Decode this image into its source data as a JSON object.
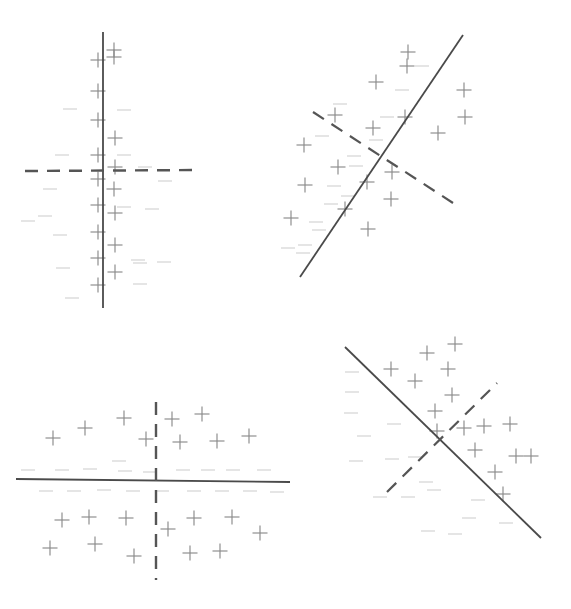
{
  "figure": {
    "title": "",
    "type": "scatter-classification-panels",
    "width": 571,
    "height": 609,
    "background_color": "#ffffff",
    "panel_count": 4,
    "marker_plus_color": "#8a8a8a",
    "marker_minus_color": "#b9b9b9",
    "solid_line_color": "#4a4a4a",
    "dashed_line_color": "#555555"
  },
  "chart_data": {
    "type": "scatter",
    "title": "",
    "subtitle": "",
    "xlabel": "",
    "ylabel": "",
    "grid": false,
    "legend": null,
    "axis_ticks": [],
    "panels": [
      {
        "id": "top-left",
        "name": "panel-top-left",
        "label": "",
        "lines": [
          {
            "name": "solid-boundary",
            "style": "solid",
            "x1": 103,
            "y1": 32,
            "x2": 103,
            "y2": 308,
            "color": "#4a4a4a",
            "width": 1.8
          },
          {
            "name": "dashed-boundary",
            "style": "dashed",
            "x1": 25,
            "y1": 171,
            "x2": 201,
            "y2": 170,
            "color": "#555555",
            "width": 2.4
          }
        ],
        "plus_points": [
          [
            114,
            57
          ],
          [
            98,
            91
          ],
          [
            98,
            120
          ],
          [
            115,
            138
          ],
          [
            98,
            155
          ],
          [
            115,
            167
          ],
          [
            114,
            189
          ],
          [
            98,
            179
          ],
          [
            98,
            205
          ],
          [
            115,
            213
          ],
          [
            98,
            232
          ],
          [
            115,
            245
          ],
          [
            98,
            258
          ],
          [
            115,
            272
          ],
          [
            98,
            285
          ],
          [
            114,
            50
          ],
          [
            98,
            60
          ]
        ],
        "minus_points": [
          [
            70,
            109
          ],
          [
            124,
            110
          ],
          [
            62,
            155
          ],
          [
            124,
            155
          ],
          [
            145,
            167
          ],
          [
            50,
            189
          ],
          [
            124,
            207
          ],
          [
            152,
            209
          ],
          [
            28,
            221
          ],
          [
            60,
            235
          ],
          [
            138,
            260
          ],
          [
            140,
            263
          ],
          [
            164,
            262
          ],
          [
            63,
            268
          ],
          [
            140,
            284
          ],
          [
            72,
            298
          ],
          [
            45,
            216
          ],
          [
            165,
            181
          ]
        ]
      },
      {
        "id": "top-right",
        "name": "panel-top-right",
        "label": "",
        "lines": [
          {
            "name": "solid-boundary",
            "style": "solid",
            "x1": 463,
            "y1": 35,
            "x2": 300,
            "y2": 277,
            "color": "#4a4a4a",
            "width": 1.8
          },
          {
            "name": "dashed-boundary",
            "style": "dashed",
            "x1": 313,
            "y1": 112,
            "x2": 453,
            "y2": 203,
            "color": "#555555",
            "width": 2.2
          }
        ],
        "plus_points": [
          [
            408,
            52
          ],
          [
            376,
            82
          ],
          [
            335,
            115
          ],
          [
            405,
            117
          ],
          [
            464,
            90
          ],
          [
            465,
            117
          ],
          [
            304,
            145
          ],
          [
            373,
            128
          ],
          [
            438,
            133
          ],
          [
            338,
            167
          ],
          [
            305,
            185
          ],
          [
            392,
            172
          ],
          [
            391,
            199
          ],
          [
            345,
            209
          ],
          [
            291,
            218
          ],
          [
            368,
            229
          ],
          [
            367,
            182
          ],
          [
            407,
            66
          ]
        ],
        "minus_points": [
          [
            422,
            66
          ],
          [
            402,
            90
          ],
          [
            387,
            117
          ],
          [
            376,
            140
          ],
          [
            354,
            156
          ],
          [
            356,
            166
          ],
          [
            334,
            186
          ],
          [
            348,
            196
          ],
          [
            331,
            204
          ],
          [
            316,
            222
          ],
          [
            319,
            230
          ],
          [
            305,
            245
          ],
          [
            303,
            253
          ],
          [
            288,
            248
          ],
          [
            322,
            136
          ],
          [
            340,
            104
          ]
        ]
      },
      {
        "id": "bottom-left",
        "name": "panel-bottom-left",
        "label": "",
        "lines": [
          {
            "name": "solid-boundary",
            "style": "solid",
            "x1": 16,
            "y1": 479,
            "x2": 290,
            "y2": 482,
            "color": "#4a4a4a",
            "width": 1.8
          },
          {
            "name": "dashed-boundary",
            "style": "dashed",
            "x1": 156,
            "y1": 402,
            "x2": 156,
            "y2": 580,
            "color": "#555555",
            "width": 2.4
          }
        ],
        "plus_points": [
          [
            53,
            438
          ],
          [
            85,
            428
          ],
          [
            124,
            418
          ],
          [
            146,
            439
          ],
          [
            172,
            419
          ],
          [
            202,
            414
          ],
          [
            180,
            442
          ],
          [
            217,
            441
          ],
          [
            249,
            436
          ],
          [
            62,
            520
          ],
          [
            89,
            517
          ],
          [
            126,
            518
          ],
          [
            168,
            529
          ],
          [
            194,
            518
          ],
          [
            232,
            517
          ],
          [
            50,
            548
          ],
          [
            95,
            544
          ],
          [
            134,
            556
          ],
          [
            190,
            553
          ],
          [
            220,
            551
          ],
          [
            260,
            533
          ]
        ],
        "minus_points": [
          [
            28,
            470
          ],
          [
            62,
            470
          ],
          [
            90,
            469
          ],
          [
            125,
            471
          ],
          [
            150,
            472
          ],
          [
            183,
            470
          ],
          [
            208,
            470
          ],
          [
            233,
            470
          ],
          [
            264,
            470
          ],
          [
            46,
            491
          ],
          [
            74,
            491
          ],
          [
            104,
            490
          ],
          [
            133,
            491
          ],
          [
            162,
            491
          ],
          [
            194,
            491
          ],
          [
            222,
            491
          ],
          [
            250,
            491
          ],
          [
            277,
            492
          ],
          [
            119,
            461
          ]
        ]
      },
      {
        "id": "bottom-right",
        "name": "panel-bottom-right",
        "label": "",
        "lines": [
          {
            "name": "solid-boundary",
            "style": "solid",
            "x1": 345,
            "y1": 347,
            "x2": 541,
            "y2": 538,
            "color": "#4a4a4a",
            "width": 1.8
          },
          {
            "name": "dashed-boundary",
            "style": "dashed",
            "x1": 387,
            "y1": 492,
            "x2": 497,
            "y2": 383,
            "color": "#555555",
            "width": 2.2
          }
        ],
        "plus_points": [
          [
            427,
            353
          ],
          [
            391,
            369
          ],
          [
            448,
            369
          ],
          [
            415,
            381
          ],
          [
            452,
            395
          ],
          [
            435,
            411
          ],
          [
            437,
            431
          ],
          [
            464,
            428
          ],
          [
            484,
            426
          ],
          [
            510,
            424
          ],
          [
            475,
            450
          ],
          [
            516,
            456
          ],
          [
            495,
            472
          ],
          [
            503,
            494
          ],
          [
            531,
            456
          ],
          [
            455,
            344
          ]
        ],
        "minus_points": [
          [
            352,
            392
          ],
          [
            351,
            413
          ],
          [
            394,
            424
          ],
          [
            364,
            436
          ],
          [
            392,
            459
          ],
          [
            415,
            457
          ],
          [
            356,
            461
          ],
          [
            426,
            482
          ],
          [
            434,
            490
          ],
          [
            380,
            497
          ],
          [
            408,
            497
          ],
          [
            478,
            500
          ],
          [
            469,
            518
          ],
          [
            428,
            531
          ],
          [
            455,
            534
          ],
          [
            506,
            523
          ],
          [
            352,
            372
          ]
        ]
      }
    ]
  }
}
